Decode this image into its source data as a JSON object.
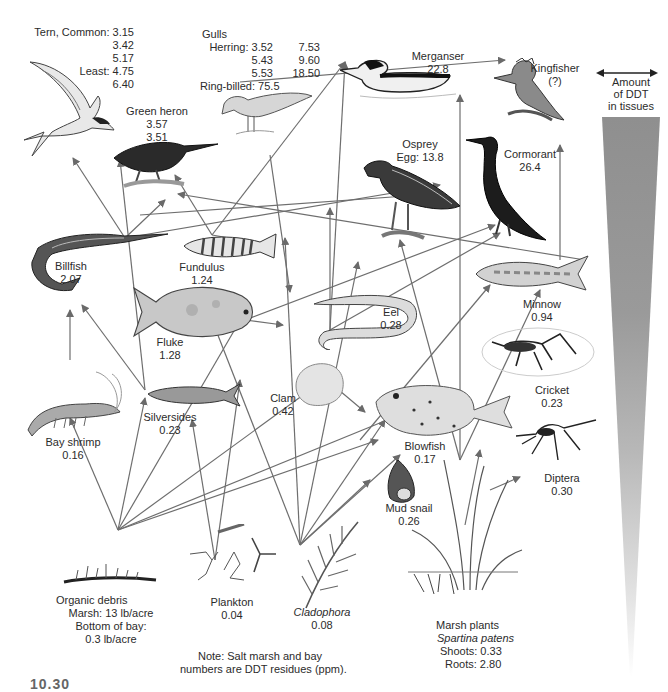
{
  "diagram": {
    "type": "food-web",
    "topic": "DDT biomagnification in a salt marsh / bay ecosystem",
    "legend": {
      "label_lines": [
        "Amount",
        "of DDT",
        "in tissues"
      ],
      "icon": "double-headed-arrow",
      "wedge_colors": {
        "top": "#8f8f8f",
        "bottom": "#ffffff"
      }
    },
    "note_lines": [
      "Note: Salt marsh and bay",
      "numbers are DDT residues (ppm)."
    ],
    "figure_number": "10.30"
  },
  "organisms": {
    "tern": {
      "lines": [
        {
          "name": "Tern, Common:",
          "value": "3.15"
        },
        {
          "name": "",
          "value": "3.42"
        },
        {
          "name": "",
          "value": "5.17"
        },
        {
          "name": "Least:",
          "value": "4.75"
        },
        {
          "name": "",
          "value": "6.40"
        }
      ]
    },
    "gulls": {
      "title": "Gulls",
      "lines": [
        {
          "name": "Herring:",
          "v1": "3.52",
          "v2": "7.53"
        },
        {
          "name": "",
          "v1": "5.43",
          "v2": "9.60"
        },
        {
          "name": "",
          "v1": "5.53",
          "v2": "18.50"
        },
        {
          "name": "Ring-billed:",
          "v1": "75.5",
          "v2": ""
        }
      ]
    },
    "green_heron": {
      "name": "Green heron",
      "values": [
        "3.57",
        "3.51"
      ]
    },
    "merganser": {
      "name": "Merganser",
      "value": "22.8"
    },
    "kingfisher": {
      "name": "Kingfisher",
      "value": "(?)"
    },
    "osprey": {
      "name": "Osprey",
      "value": "Egg: 13.8"
    },
    "cormorant": {
      "name": "Cormorant",
      "value": "26.4"
    },
    "billfish": {
      "name": "Billfish",
      "value": "2.07"
    },
    "fundulus": {
      "name": "Fundulus",
      "value": "1.24"
    },
    "fluke": {
      "name": "Fluke",
      "value": "1.28"
    },
    "eel": {
      "name": "Eel",
      "value": "0.28"
    },
    "minnow": {
      "name": "Minnow",
      "value": "0.94"
    },
    "cricket": {
      "name": "Cricket",
      "value": "0.23"
    },
    "bay_shrimp": {
      "name": "Bay shrimp",
      "value": "0.16"
    },
    "silversides": {
      "name": "Silversides",
      "value": "0.23"
    },
    "clam": {
      "name": "Clam",
      "value": "0.42"
    },
    "blowfish": {
      "name": "Blowfish",
      "value": "0.17"
    },
    "diptera": {
      "name": "Diptera",
      "value": "0.30"
    },
    "mud_snail": {
      "name": "Mud snail",
      "value": "0.26"
    },
    "organic_debris": {
      "name": "Organic debris",
      "lines": [
        "Marsh: 13 lb/acre",
        "Bottom of bay:",
        "0.3 lb/acre"
      ]
    },
    "plankton": {
      "name": "Plankton",
      "value": "0.04"
    },
    "cladophora": {
      "name": "Cladophora",
      "value": "0.08"
    },
    "marsh_plants": {
      "name": "Marsh plants",
      "species": "Spartina patens",
      "lines": [
        "Shoots: 0.33",
        "Roots: 2.80"
      ]
    }
  },
  "arrows": [
    [
      118,
      530,
      70,
      418
    ],
    [
      118,
      530,
      145,
      398
    ],
    [
      118,
      530,
      245,
      312
    ],
    [
      118,
      530,
      310,
      390
    ],
    [
      118,
      530,
      378,
      440
    ],
    [
      118,
      530,
      392,
      418
    ],
    [
      215,
      560,
      240,
      380
    ],
    [
      215,
      560,
      192,
      420
    ],
    [
      300,
      545,
      285,
      238
    ],
    [
      300,
      545,
      370,
      480
    ],
    [
      300,
      545,
      400,
      455
    ],
    [
      300,
      545,
      385,
      420
    ],
    [
      300,
      545,
      212,
      320
    ],
    [
      300,
      545,
      358,
      262
    ],
    [
      70,
      360,
      70,
      310
    ],
    [
      145,
      390,
      82,
      305
    ],
    [
      145,
      390,
      120,
      160
    ],
    [
      315,
      370,
      365,
      412
    ],
    [
      125,
      238,
      165,
      200
    ],
    [
      125,
      238,
      73,
      158
    ],
    [
      125,
      238,
      440,
      185
    ],
    [
      212,
      235,
      175,
      175
    ],
    [
      212,
      235,
      270,
      245
    ],
    [
      212,
      235,
      345,
      62
    ],
    [
      245,
      320,
      283,
      325
    ],
    [
      245,
      320,
      495,
      225
    ],
    [
      330,
      330,
      330,
      208
    ],
    [
      330,
      330,
      345,
      62
    ],
    [
      330,
      330,
      500,
      233
    ],
    [
      460,
      460,
      400,
      240
    ],
    [
      460,
      460,
      460,
      95
    ],
    [
      460,
      460,
      540,
      290
    ],
    [
      360,
      440,
      490,
      285
    ],
    [
      465,
      525,
      480,
      450
    ],
    [
      490,
      490,
      520,
      477
    ],
    [
      585,
      260,
      178,
      194
    ],
    [
      560,
      260,
      560,
      145
    ],
    [
      140,
      215,
      420,
      195
    ],
    [
      240,
      82,
      505,
      60
    ],
    [
      270,
      155,
      290,
      292
    ]
  ]
}
